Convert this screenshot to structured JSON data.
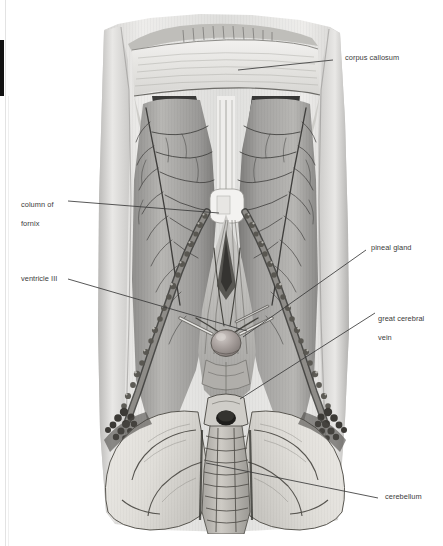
{
  "figure": {
    "kind": "anatomical-illustration",
    "style": "grayscale halftone medical illustration",
    "canvas": {
      "width": 443,
      "height": 546
    },
    "background_color": "#ffffff",
    "ink_color": "#3a3a3a"
  },
  "labels": [
    {
      "id": "corpus-callosum",
      "text": "corpus callosum",
      "lines": [
        "corpus callosum"
      ],
      "text_x": 345,
      "text_y": 55,
      "side": "right",
      "leader": [
        [
          238,
          70
        ],
        [
          333,
          60
        ]
      ]
    },
    {
      "id": "column-of-fornix",
      "text": "column of fornix",
      "lines": [
        "column of",
        "fornix"
      ],
      "text_x": 21,
      "text_y": 193,
      "side": "left",
      "leader": [
        [
          68,
          201
        ],
        [
          219,
          213
        ]
      ]
    },
    {
      "id": "ventricle-iii",
      "text": "ventricle III",
      "lines": [
        "ventricle III"
      ],
      "text_x": 21,
      "text_y": 274,
      "side": "left",
      "leader": [
        [
          68,
          279
        ],
        [
          247,
          331
        ]
      ]
    },
    {
      "id": "pineal-gland",
      "text": "pineal gland",
      "lines": [
        "pineal gland"
      ],
      "text_x": 371,
      "text_y": 244,
      "side": "right",
      "leader": [
        [
          366,
          250
        ],
        [
          243,
          337
        ]
      ]
    },
    {
      "id": "great-cerebral-vein",
      "text": "great cerebral vein",
      "lines": [
        "great cerebral",
        "vein"
      ],
      "text_x": 378,
      "text_y": 306,
      "side": "right",
      "leader": [
        [
          375,
          313
        ],
        [
          240,
          399
        ]
      ]
    },
    {
      "id": "cerebellum",
      "text": "cerebellum",
      "lines": [
        "cerebellum"
      ],
      "text_x": 385,
      "text_y": 493,
      "side": "right",
      "leader": [
        [
          206,
          463
        ],
        [
          378,
          498
        ]
      ]
    }
  ],
  "artifacts": {
    "left_black_bar": "scan edge black bar",
    "left_rule": "faint page-edge rule"
  }
}
